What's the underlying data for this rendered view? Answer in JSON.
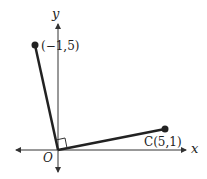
{
  "diagram": {
    "axes": {
      "x_label": "x",
      "y_label": "y",
      "origin_label": "O"
    },
    "points": [
      {
        "name": "A",
        "label": "(−1,5)",
        "coords": [
          -1,
          5
        ]
      },
      {
        "name": "C",
        "label": "C(5,1)",
        "coords": [
          5,
          1
        ]
      }
    ],
    "segments": [
      [
        "O",
        "A"
      ],
      [
        "O",
        "C"
      ]
    ],
    "right_angle_at": "O",
    "colors": {
      "line": "#222222",
      "axis": "#333333"
    }
  }
}
